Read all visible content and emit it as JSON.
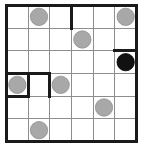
{
  "puzzle": {
    "title": "Masyu Grid Puzzle",
    "type": "masyu",
    "rows": 6,
    "cols": 6,
    "cell_size": 22,
    "colors": {
      "background": "#ffffff",
      "thin_grid_line": "#8d8d8d",
      "thick_line": "#1a1a1a",
      "white_pearl_fill": "#a8a8a8",
      "black_pearl_fill": "#111111"
    },
    "counts": {
      "white_pearls": "7",
      "black_pearls": "1",
      "total_pearls": "8",
      "thick_segments": "7"
    },
    "pearls": [
      {
        "id": "pearl-r1c2",
        "row": 1,
        "col": 2,
        "kind": "white",
        "label": "white pearl at row 1 column 2"
      },
      {
        "id": "pearl-r1c6",
        "row": 1,
        "col": 6,
        "kind": "white",
        "label": "white pearl at row 1 column 6"
      },
      {
        "id": "pearl-r2c4",
        "row": 2,
        "col": 4,
        "kind": "white",
        "label": "white pearl at row 2 column 4"
      },
      {
        "id": "pearl-r3c6",
        "row": 3,
        "col": 6,
        "kind": "black",
        "label": "black pearl at row 3 column 6"
      },
      {
        "id": "pearl-r4c1",
        "row": 4,
        "col": 1,
        "kind": "white",
        "label": "white pearl at row 4 column 1"
      },
      {
        "id": "pearl-r4c3",
        "row": 4,
        "col": 3,
        "kind": "white",
        "label": "white pearl at row 4 column 3"
      },
      {
        "id": "pearl-r5c5",
        "row": 5,
        "col": 5,
        "kind": "white",
        "label": "white pearl at row 5 column 5"
      },
      {
        "id": "pearl-r6c2",
        "row": 6,
        "col": 2,
        "kind": "white",
        "label": "white pearl at row 6 column 2"
      }
    ],
    "thin_vertical_lines": [
      1,
      2,
      3,
      4,
      5
    ],
    "thin_horizontal_lines": [
      1,
      2,
      3,
      4,
      5
    ],
    "thick_segments": [
      {
        "id": "seg-v-c3-r1",
        "orientation": "vertical",
        "x": 3,
        "y1": 0,
        "y2": 1,
        "label": "vertical edge right of row 1 column 3"
      },
      {
        "id": "seg-h-r2-c6",
        "orientation": "horizontal",
        "y": 2,
        "x1": 5,
        "x2": 6,
        "label": "horizontal edge above row 3 column 6"
      },
      {
        "id": "seg-h-r3-c1",
        "orientation": "horizontal",
        "y": 3,
        "x1": 0,
        "x2": 1,
        "label": "horizontal edge above row 4 column 1"
      },
      {
        "id": "seg-h-r3-c2",
        "orientation": "horizontal",
        "y": 3,
        "x1": 1,
        "x2": 2,
        "label": "horizontal edge above row 4 column 2"
      },
      {
        "id": "seg-v-c1-r4",
        "orientation": "vertical",
        "x": 1,
        "y1": 3,
        "y2": 4,
        "label": "vertical edge left of row 4 column 2"
      },
      {
        "id": "seg-v-c2-r4",
        "orientation": "vertical",
        "x": 2,
        "y1": 3,
        "y2": 4,
        "label": "vertical edge right of row 4 column 2"
      },
      {
        "id": "seg-h-r4-c1",
        "orientation": "horizontal",
        "y": 4,
        "x1": 0,
        "x2": 1,
        "label": "horizontal edge below row 4 column 1"
      }
    ],
    "border": {
      "label": "outer puzzle border",
      "style": "thick"
    }
  }
}
